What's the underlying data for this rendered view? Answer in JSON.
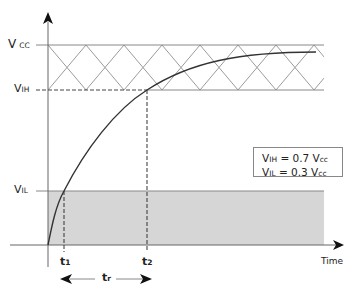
{
  "diagram": {
    "y_labels": {
      "vcc": {
        "main": "V",
        "sub": "CC"
      },
      "vih": {
        "main": "V",
        "sub": "IH"
      },
      "vil": {
        "main": "V",
        "sub": "IL"
      }
    },
    "x_labels": {
      "t1": {
        "main": "t",
        "sub": "1"
      },
      "t2": {
        "main": "t",
        "sub": "2"
      },
      "tr": {
        "main": "t",
        "sub": "r"
      },
      "time": "Time"
    },
    "legend": {
      "line1": {
        "v": "V",
        "sub": "IH",
        "eq": " = 0.7 V",
        "sub2": "cc"
      },
      "line2": {
        "v": "V",
        "sub": "IL",
        "eq": " = 0.3 V",
        "sub2": "cc"
      }
    },
    "regions": {
      "hatched": "undefined zone between VIH and VCC",
      "shaded": "region below VIL"
    },
    "colors": {
      "line": "#333333",
      "grid": "#888888",
      "hatch": "#999999",
      "shade": "#d4d4d4"
    }
  }
}
